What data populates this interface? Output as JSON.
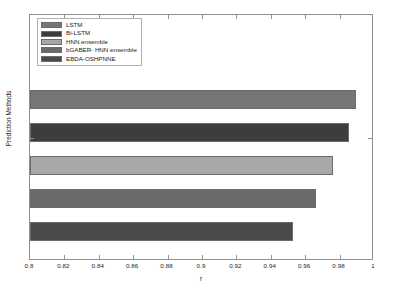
{
  "chart_data": {
    "type": "bar",
    "orientation": "horizontal",
    "title": "",
    "xlabel": "r",
    "ylabel": "Prediction Methods",
    "xlim": [
      0.8,
      1.0
    ],
    "xticks": [
      "0.8",
      "0.82",
      "0.84",
      "0.86",
      "0.88",
      "0.9",
      "0.92",
      "0.94",
      "0.96",
      "0.98",
      "1"
    ],
    "xtick_values": [
      0.8,
      0.82,
      0.84,
      0.86,
      0.88,
      0.9,
      0.92,
      0.94,
      0.96,
      0.98,
      1.0
    ],
    "grid": false,
    "legend_position": "upper left",
    "categories": [
      "LSTM",
      "Bi-LSTM",
      "HNN ensemble",
      "bGABER- HNN ensemble",
      "EBDA-OSHPNNE"
    ],
    "values": [
      0.9895,
      0.9855,
      0.976,
      0.966,
      0.953
    ],
    "colors": [
      "#767676",
      "#3d3d3d",
      "#a8a8a8",
      "#6a6a6a",
      "#4a4a4a"
    ],
    "series": [
      {
        "name": "r",
        "values": [
          0.9895,
          0.9855,
          0.976,
          0.966,
          0.953
        ]
      }
    ],
    "bars": [
      {
        "label": "LSTM",
        "value": 0.9895,
        "color": "#767676"
      },
      {
        "label": "Bi-LSTM",
        "value": 0.9855,
        "color": "#3d3d3d"
      },
      {
        "label": "HNN ensemble",
        "value": 0.976,
        "color": "#a8a8a8"
      },
      {
        "label": "bGABER- HNN ensemble",
        "value": 0.966,
        "color": "#6a6a6a"
      },
      {
        "label": "EBDA-OSHPNNE",
        "value": 0.953,
        "color": "#4a4a4a"
      }
    ]
  },
  "legend": {
    "entries": [
      {
        "label": "LSTM",
        "color": "#767676"
      },
      {
        "label": "Bi-LSTM",
        "color": "#3d3d3d"
      },
      {
        "label": "HNN ensemble",
        "color": "#a8a8a8"
      },
      {
        "label": "bGABER- HNN ensemble",
        "color": "#6a6a6a"
      },
      {
        "label": "EBDA-OSHPNNE",
        "color": "#4a4a4a"
      }
    ]
  },
  "axes": {
    "x_label": "r",
    "y_label": "Prediction Methods"
  }
}
